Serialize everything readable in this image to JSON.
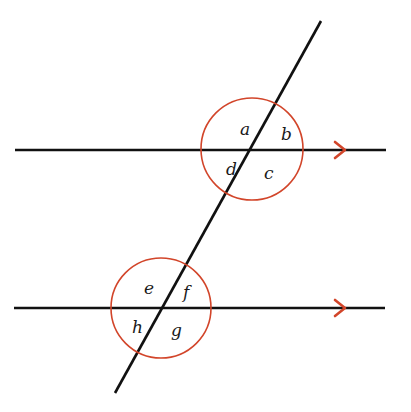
{
  "diagram": {
    "type": "parallel-lines-transversal",
    "colors": {
      "line": "#111111",
      "circle": "#d2452a",
      "arrow": "#d2452a",
      "background": "#ffffff"
    },
    "lines": {
      "top": {
        "x1": 15,
        "y1": 150,
        "x2": 386,
        "y2": 150
      },
      "bottom": {
        "x1": 14,
        "y1": 308,
        "x2": 385,
        "y2": 308
      },
      "transversal": {
        "x1": 321,
        "y1": 21,
        "x2": 115,
        "y2": 393
      }
    },
    "circles": [
      {
        "name": "upper-intersection",
        "cx": 252,
        "cy": 149,
        "r": 51
      },
      {
        "name": "lower-intersection",
        "cx": 161,
        "cy": 308,
        "r": 50
      }
    ],
    "arrows": [
      {
        "name": "top-parallel-arrow",
        "x": 345,
        "y": 150
      },
      {
        "name": "bottom-parallel-arrow",
        "x": 345,
        "y": 308
      }
    ],
    "angle_labels": {
      "a": {
        "text": "a",
        "x": 240,
        "y": 135
      },
      "b": {
        "text": "b",
        "x": 281,
        "y": 140
      },
      "c": {
        "text": "c",
        "x": 264,
        "y": 179
      },
      "d": {
        "text": "d",
        "x": 226,
        "y": 175
      },
      "e": {
        "text": "e",
        "x": 144,
        "y": 294
      },
      "f": {
        "text": "f",
        "x": 183,
        "y": 298
      },
      "g": {
        "text": "g",
        "x": 171,
        "y": 336
      },
      "h": {
        "text": "h",
        "x": 132,
        "y": 333
      }
    }
  }
}
